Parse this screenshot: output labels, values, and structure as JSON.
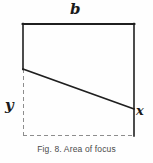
{
  "figure": {
    "caption": "Fig. 8. Area of focus",
    "background_color": "#fefefe",
    "stroke_color": "#1f1f1f",
    "dashed_color": "#8d8d8d",
    "caption_color": "#4a4a4a",
    "labels": {
      "top_width": "b",
      "left_height": "y",
      "right_height": "x"
    },
    "geometry": {
      "type": "diagram",
      "description": "Rectangle outline with a diagonal chord splitting it; lower-left portion drawn with dashed lines.",
      "points": {
        "top_left": [
          23,
          24
        ],
        "top_right": [
          134,
          24
        ],
        "bottom_right": [
          134,
          136
        ],
        "bottom_left": [
          23,
          136
        ],
        "diagonal_start": [
          23,
          69
        ],
        "diagonal_end": [
          134,
          109
        ]
      },
      "solid_segments": [
        {
          "name": "top-edge",
          "from": [
            23,
            24
          ],
          "to": [
            134,
            24
          ]
        },
        {
          "name": "right-edge",
          "from": [
            134,
            24
          ],
          "to": [
            134,
            136
          ]
        },
        {
          "name": "left-edge-upper",
          "from": [
            23,
            24
          ],
          "to": [
            23,
            69
          ]
        },
        {
          "name": "diagonal-chord",
          "from": [
            23,
            69
          ],
          "to": [
            134,
            109
          ]
        }
      ],
      "dashed_segments": [
        {
          "name": "left-edge-lower",
          "from": [
            23,
            69
          ],
          "to": [
            23,
            136
          ]
        },
        {
          "name": "bottom-edge",
          "from": [
            23,
            136
          ],
          "to": [
            134,
            136
          ]
        }
      ]
    }
  }
}
